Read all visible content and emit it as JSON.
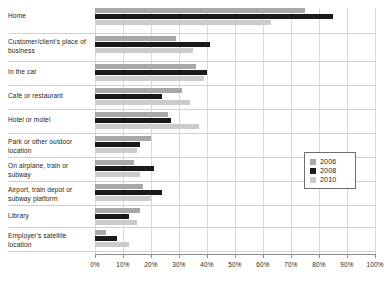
{
  "chart_data": {
    "type": "bar",
    "orientation": "horizontal",
    "title": "",
    "subtitle": "",
    "xlabel": "",
    "ylabel": "",
    "xlim": [
      0,
      100
    ],
    "x_tick_labels": [
      "0%",
      "10%",
      "20%",
      "30%",
      "40%",
      "50%",
      "60%",
      "70%",
      "80%",
      "90%",
      "100%"
    ],
    "x_ticks": [
      0,
      10,
      20,
      30,
      40,
      50,
      60,
      70,
      80,
      90,
      100
    ],
    "grid": true,
    "legend_position": "middle-right",
    "categories": [
      "Home",
      "Customer/client's place of business",
      "In the car",
      "Café or restaurant",
      "Hotel or motel",
      "Park or other outdoor location",
      "On airplane, train or subway",
      "Airport, train depot or subway platform",
      "Library",
      "Employer's satellite location"
    ],
    "series": [
      {
        "name": "2006",
        "color": "#a8a8a8",
        "values": [
          75,
          29,
          36,
          31,
          26,
          20,
          14,
          17,
          16,
          4
        ]
      },
      {
        "name": "2008",
        "color": "#1a1a1a",
        "values": [
          85,
          41,
          40,
          24,
          27,
          16,
          21,
          24,
          12,
          8
        ]
      },
      {
        "name": "2010",
        "color": "#cbcbcb",
        "values": [
          63,
          35,
          39,
          34,
          37,
          15,
          16,
          20,
          15,
          12
        ]
      }
    ]
  },
  "legend": {
    "items": [
      {
        "label": "2006",
        "color": "#a8a8a8"
      },
      {
        "label": "2008",
        "color": "#1a1a1a"
      },
      {
        "label": "2010",
        "color": "#cbcbcb"
      }
    ]
  }
}
